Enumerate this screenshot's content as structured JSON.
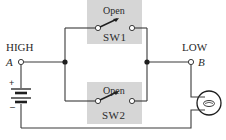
{
  "diagram": {
    "type": "circuit",
    "nodes": {
      "high": {
        "label": "HIGH",
        "terminal": "A"
      },
      "low": {
        "label": "LOW",
        "terminal": "B"
      }
    },
    "switches": [
      {
        "name": "SW1",
        "state": "Open"
      },
      {
        "name": "SW2",
        "state": "Open"
      }
    ],
    "battery": {
      "positive": "+",
      "negative": "–"
    },
    "lamp": {
      "icon": "lamp-icon"
    },
    "colors": {
      "wire": "#3a3a3a",
      "switch_box": "#d6d6d6",
      "background": "#ffffff"
    }
  }
}
